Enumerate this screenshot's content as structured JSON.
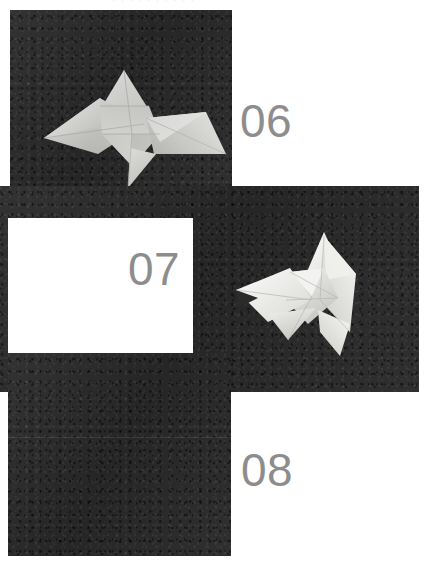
{
  "page": {
    "background_color": "#ffffff",
    "width": 427,
    "height": 569,
    "header_remnant": "· · · · · · · · · ·",
    "kind": "origami-instruction-photo-sequence"
  },
  "palette": {
    "page_background": "#ffffff",
    "panel_dark": "#2b2b2b",
    "numeral_gray": "#8d8d8d",
    "paper_white": "#f4f4f2",
    "paper_shadow": "#c9c9c6"
  },
  "steps": [
    {
      "number": "06",
      "panel_name": "photo-panel-06",
      "model_name": "origami-model-06",
      "description": "Folded paper model photographed on dark textured card, step six"
    },
    {
      "number": "07",
      "panel_name": "photo-panel-07",
      "model_name": "origami-model-07",
      "description": "Folded paper model photographed on dark textured card, step seven"
    },
    {
      "number": "08",
      "panel_name": "photo-panel-08",
      "model_name": "origami-model-08",
      "description": "Folded paper model photographed on dark textured card, step eight"
    }
  ]
}
